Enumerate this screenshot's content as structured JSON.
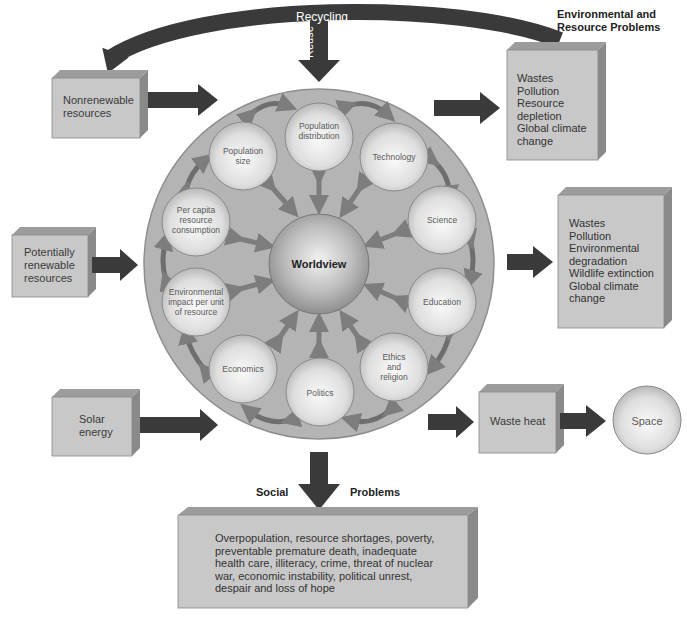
{
  "colors": {
    "box_face": "#c8c8c8",
    "box_top": "#9c9c9c",
    "box_side": "#8a8a8a",
    "big_circle": "#b4b4b4",
    "sphere_light": "#f4f4f4",
    "sphere_dark": "#a8a8a8",
    "arrow_dark": "#3a3a3a",
    "arrow_gray": "#7d7d7d"
  },
  "top": {
    "recycling_label": "Recycling",
    "reuse_label": "Reuse"
  },
  "inputs": [
    {
      "id": "nonrenewable",
      "label": "Nonrenewable\nresources"
    },
    {
      "id": "potentially-renewable",
      "label": "Potentially\nrenewable\nresources"
    },
    {
      "id": "solar",
      "label": "Solar\nenergy"
    }
  ],
  "center": {
    "label": "Worldview"
  },
  "factors": [
    {
      "id": "population-distribution",
      "label": "Population\ndistribution"
    },
    {
      "id": "technology",
      "label": "Technology"
    },
    {
      "id": "science",
      "label": "Science"
    },
    {
      "id": "education",
      "label": "Education"
    },
    {
      "id": "ethics-religion",
      "label": "Ethics\nand\nreligion"
    },
    {
      "id": "politics",
      "label": "Politics"
    },
    {
      "id": "economics",
      "label": "Economics"
    },
    {
      "id": "environmental-impact",
      "label": "Environmental\nimpact per unit\nof resource"
    },
    {
      "id": "per-capita-consumption",
      "label": "Per capita\nresource\nconsumption"
    },
    {
      "id": "population-size",
      "label": "Population\nsize"
    }
  ],
  "outputs": {
    "env_heading": "Environmental and\nResource Problems",
    "env_box1": "Wastes\nPollution\nResource\n  depletion\nGlobal climate\n  change",
    "env_box2": "Wastes\nPollution\nEnvironmental\n  degradation\nWildlife extinction\nGlobal climate\n  change",
    "waste_heat": "Waste heat",
    "space": "Space",
    "social_label": "Social",
    "problems_label": "Problems",
    "social_box": "Overpopulation, resource shortages, poverty,\npreventable premature death, inadequate\nhealth care, illiteracy, crime, threat of nuclear\nwar, economic instability, political unrest,\ndespair and loss of hope"
  }
}
